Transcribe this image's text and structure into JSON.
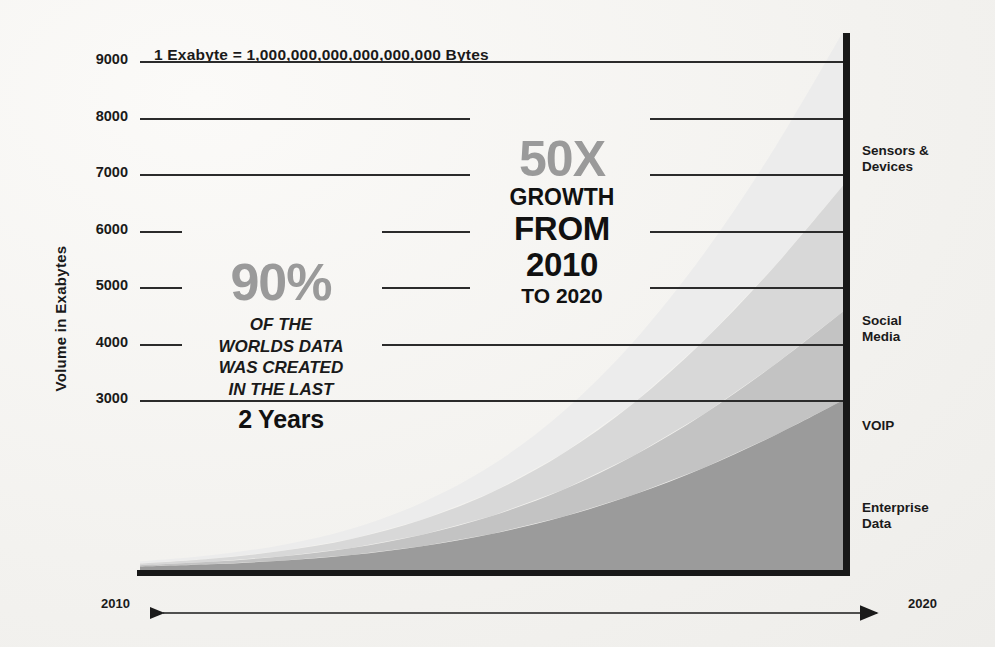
{
  "title": "1 Exabyte = 1,000,000,000,000,000,000 Bytes",
  "axes": {
    "ylabel": "Volume in Exabytes",
    "yticks": [
      "9000",
      "8000",
      "7000",
      "6000",
      "5000",
      "4000",
      "3000"
    ],
    "x_start": "2010",
    "x_end": "2020"
  },
  "series_labels": [
    {
      "line1": "Sensors &",
      "line2": "Devices"
    },
    {
      "line1": "Social",
      "line2": "Media"
    },
    {
      "line1": "VOIP",
      "line2": ""
    },
    {
      "line1": "Enterprise",
      "line2": "Data"
    }
  ],
  "annotation_90": {
    "headline": "90%",
    "line1": "OF THE",
    "line2": "WORLDS DATA",
    "line3": "WAS CREATED",
    "line4": "IN THE LAST",
    "emphasis": "2 Years"
  },
  "annotation_50": {
    "headline": "50X",
    "line1": "GROWTH",
    "line2": "FROM",
    "line3": "2010",
    "line4": "TO 2020"
  },
  "colors": {
    "enterprise_data": "#9b9b9b",
    "voip": "#c3c3c3",
    "social_media": "#d8d8d8",
    "sensors_devices": "#ececec",
    "axis": "#181818",
    "grid": "#2b2b2b",
    "accent_gray": "#9a9a9a",
    "background": "#f2f1ee"
  },
  "chart_data": {
    "type": "area",
    "title": "1 Exabyte = 1,000,000,000,000,000,000 Bytes",
    "xlabel": "",
    "ylabel": "Volume in Exabytes",
    "stacked": true,
    "grid": true,
    "legend": "right",
    "xlim": [
      2010,
      2020
    ],
    "ylim": [
      0,
      9500
    ],
    "yticks": [
      3000,
      4000,
      5000,
      6000,
      7000,
      8000,
      9000
    ],
    "x": [
      2010,
      2011,
      2012,
      2013,
      2014,
      2015,
      2016,
      2017,
      2018,
      2019,
      2020
    ],
    "series": [
      {
        "name": "Enterprise Data",
        "color": "#9b9b9b",
        "values": [
          60,
          100,
          165,
          265,
          420,
          640,
          940,
          1330,
          1810,
          2380,
          3020
        ]
      },
      {
        "name": "VOIP",
        "color": "#c3c3c3",
        "values": [
          25,
          45,
          75,
          125,
          205,
          320,
          480,
          690,
          950,
          1250,
          1580
        ]
      },
      {
        "name": "Social Media",
        "color": "#d8d8d8",
        "values": [
          30,
          55,
          95,
          160,
          265,
          420,
          640,
          930,
          1300,
          1740,
          2240
        ]
      },
      {
        "name": "Sensors & Devices",
        "color": "#ececec",
        "values": [
          35,
          60,
          105,
          180,
          300,
          480,
          740,
          1090,
          1540,
          2090,
          2740
        ]
      }
    ],
    "totals": [
      150,
      260,
      440,
      730,
      1190,
      1860,
      2800,
      4040,
      5600,
      7460,
      9580
    ],
    "annotations": [
      "90% OF THE WORLDS DATA WAS CREATED IN THE LAST 2 Years",
      "50X GROWTH FROM 2010 TO 2020"
    ]
  }
}
